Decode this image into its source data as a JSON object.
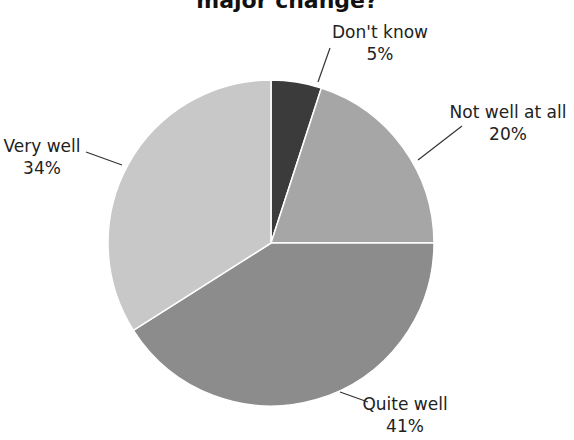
{
  "chart_data": {
    "type": "pie",
    "title": "major change?",
    "categories": [
      "Don't know",
      "Not well at all",
      "Quite well",
      "Very well"
    ],
    "values": [
      5,
      20,
      41,
      34
    ],
    "labels": [
      "5%",
      "20%",
      "41%",
      "34%"
    ],
    "colors": [
      "#3b3b3b",
      "#a6a6a6",
      "#8c8c8c",
      "#c8c8c8"
    ],
    "start_angle_deg": 0,
    "direction": "clockwise",
    "legend": "none",
    "data_labels": "outside with leader lines"
  }
}
